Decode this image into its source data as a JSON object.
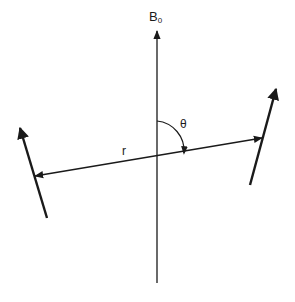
{
  "diagram": {
    "labels": {
      "field": "B",
      "field_subscript": "0",
      "angle": "θ",
      "distance": "r"
    },
    "elements": {
      "field_axis": {
        "x": 157,
        "y_top": 30,
        "y_bottom": 283
      },
      "internuclear_vector": {
        "x1": 33,
        "y1": 176,
        "x2": 263,
        "y2": 138
      },
      "left_spin": {
        "tail": [
          47,
          218
        ],
        "tip": [
          18,
          123
        ]
      },
      "right_spin": {
        "tail": [
          250,
          185
        ],
        "tip": [
          278,
          84
        ]
      },
      "angle_arc": {
        "center": [
          157,
          158
        ],
        "radius": 27
      }
    },
    "colors": {
      "line": "#1a1a1a",
      "background": "#ffffff"
    }
  }
}
